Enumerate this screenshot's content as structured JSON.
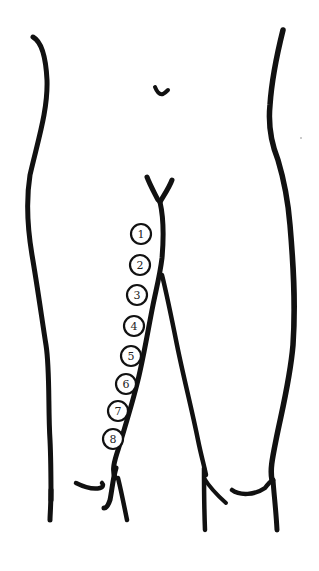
{
  "diagram": {
    "type": "anatomical line drawing",
    "colors": {
      "ink": "#111111",
      "background": "#ffffff"
    },
    "markers": [
      {
        "label": "1",
        "cx": 141,
        "cy": 234
      },
      {
        "label": "2",
        "cx": 140,
        "cy": 265
      },
      {
        "label": "3",
        "cx": 137,
        "cy": 295
      },
      {
        "label": "4",
        "cx": 134,
        "cy": 326
      },
      {
        "label": "5",
        "cx": 131,
        "cy": 356
      },
      {
        "label": "6",
        "cx": 126,
        "cy": 384
      },
      {
        "label": "7",
        "cx": 118,
        "cy": 411
      },
      {
        "label": "8",
        "cx": 113,
        "cy": 439
      }
    ]
  }
}
